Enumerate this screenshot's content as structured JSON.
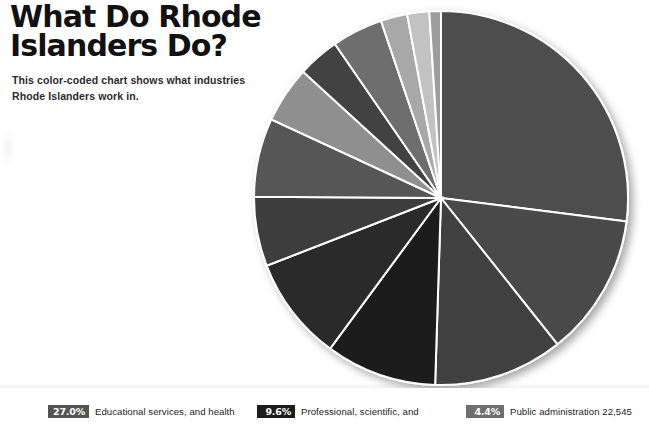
{
  "header": {
    "title": "What Do Rhode\nIslanders Do?",
    "subtitle": "This color-coded chart shows what industries\nRhode Islanders work in."
  },
  "legend": {
    "items": [
      {
        "percent": "27.0%",
        "label": "Educational services, and health",
        "swatch_color": "#545454",
        "x": 48
      },
      {
        "percent": "9.6%",
        "label": "Professional, scientific, and",
        "swatch_color": "#1d1d1d",
        "x": 257
      },
      {
        "percent": "4.4%",
        "label": "Public administration 22,545",
        "swatch_color": "#6e6e6e",
        "x": 466
      }
    ]
  },
  "chart_data": {
    "type": "pie",
    "title": "What Do Rhode Islanders Do?",
    "subtitle": "This color-coded chart shows what industries Rhode Islanders work in.",
    "start_angle_deg": -90,
    "direction": "clockwise",
    "center": {
      "x": 441,
      "y": 198
    },
    "radius": 187,
    "stroke": "#ffffff",
    "stroke_width": 2,
    "background": "#ffffff",
    "legend_position": "bottom",
    "grid": false,
    "labels": [
      "Educational services, and health",
      "Manufacturing",
      "Retail trade",
      "Professional, scientific, and",
      "Arts, entertainment, and recreation",
      "Construction",
      "Finance and insurance, and real estate",
      "Other services, except public administration",
      "Transportation and warehousing, and utilities",
      "Public administration 22,545",
      "Wholesale trade",
      "Information",
      "Agriculture, forestry, fishing and mining"
    ],
    "values": [
      27.0,
      12.3,
      11.2,
      9.6,
      9.0,
      6.0,
      6.8,
      4.9,
      3.6,
      4.4,
      2.3,
      1.9,
      1.0
    ],
    "unit": "percent",
    "colors": [
      "#4d4d4d",
      "#484848",
      "#3f3f3f",
      "#1d1d1d",
      "#2a2a2a",
      "#3c3c3c",
      "#565656",
      "#8f8f8f",
      "#434343",
      "#6e6e6e",
      "#a8a8a8",
      "#c2c2c2",
      "#9d9d9d"
    ]
  }
}
